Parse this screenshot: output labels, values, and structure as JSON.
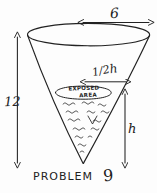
{
  "figure": {
    "title": "PROBLEM",
    "problem_number": "9",
    "ink_color": "#222222",
    "background_color": "#fdfdfd",
    "labels": {
      "top_diameter": "6",
      "cone_height": "12",
      "half_h": "h",
      "half_h_fraction": "1/2",
      "water_depth": "h",
      "exposed_line1": "EXPOSED",
      "exposed_line2": "AREA"
    },
    "icons": {
      "top_arrow": "double-headed-horizontal-arrow",
      "left_arrow": "double-headed-vertical-arrow",
      "half_h_arrow": "double-headed-horizontal-arrow",
      "right_arrow": "double-headed-vertical-arrow"
    },
    "geometry": {
      "rim_center_x": 88,
      "rim_center_y": 34,
      "rim_rx": 61,
      "rim_ry": 11,
      "apex_x": 83,
      "apex_y": 163,
      "water_center_x": 83,
      "water_center_y": 93,
      "water_rx": 28,
      "water_ry": 6
    }
  }
}
